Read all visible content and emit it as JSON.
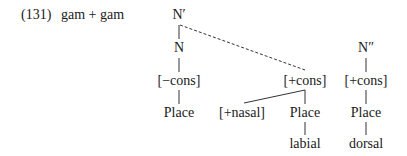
{
  "example": {
    "number": "(131)",
    "expression": "gam + gam"
  },
  "tree": {
    "left": {
      "root": "N′",
      "n": "N",
      "feature": "[−cons]",
      "place": "Place"
    },
    "middle": {
      "feature": "[+cons]",
      "nasal": "[+nasal]",
      "place": "Place",
      "articulator": "labial"
    },
    "right": {
      "root": "N″",
      "feature": "[+cons]",
      "place": "Place",
      "articulator": "dorsal"
    }
  },
  "colors": {
    "text": "#1a1a1a",
    "line": "#333333",
    "background": "#ffffff"
  }
}
